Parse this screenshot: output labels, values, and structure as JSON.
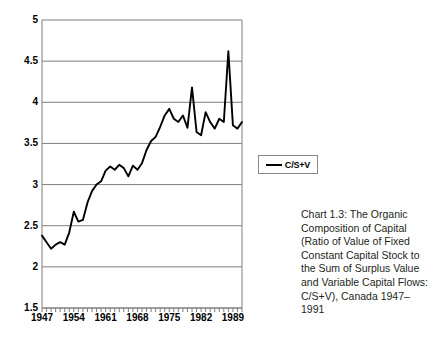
{
  "chart_data": {
    "type": "line",
    "title": "",
    "xlabel": "",
    "ylabel": "",
    "xlim": [
      1947,
      1991
    ],
    "ylim": [
      1.5,
      5
    ],
    "grid": true,
    "grid_axis": "y",
    "legend_position": "right",
    "x": [
      1947,
      1948,
      1949,
      1950,
      1951,
      1952,
      1953,
      1954,
      1955,
      1956,
      1957,
      1958,
      1959,
      1960,
      1961,
      1962,
      1963,
      1964,
      1965,
      1966,
      1967,
      1968,
      1969,
      1970,
      1971,
      1972,
      1973,
      1974,
      1975,
      1976,
      1977,
      1978,
      1979,
      1980,
      1981,
      1982,
      1983,
      1984,
      1985,
      1986,
      1987,
      1988,
      1989,
      1990,
      1991
    ],
    "series": [
      {
        "name": "C/S+V",
        "color": "#000000",
        "values": [
          2.38,
          2.3,
          2.22,
          2.27,
          2.3,
          2.27,
          2.42,
          2.67,
          2.55,
          2.57,
          2.78,
          2.92,
          3.0,
          3.04,
          3.17,
          3.22,
          3.18,
          3.24,
          3.2,
          3.1,
          3.23,
          3.18,
          3.26,
          3.42,
          3.53,
          3.58,
          3.7,
          3.84,
          3.92,
          3.8,
          3.76,
          3.84,
          3.69,
          4.18,
          3.64,
          3.6,
          3.88,
          3.76,
          3.68,
          3.8,
          3.76,
          4.62,
          3.72,
          3.68,
          3.76
        ],
        "values_tail": [
          3.7,
          3.62,
          3.84,
          3.8,
          4.78
        ]
      }
    ],
    "yticks": [
      "5",
      "4.5",
      "4",
      "3.5",
      "3",
      "2.5",
      "2",
      "1.5"
    ],
    "ytick_values": [
      5,
      4.5,
      4,
      3.5,
      3,
      2.5,
      2,
      1.5
    ],
    "xticks": [
      "1947",
      "1954",
      "1961",
      "1968",
      "1975",
      "1982",
      "1989"
    ],
    "xtick_values": [
      1947,
      1954,
      1961,
      1968,
      1975,
      1982,
      1989
    ],
    "xtick_minor_step": 1,
    "legend": [
      {
        "label": "C/S+V",
        "marker": "line",
        "color": "#000000"
      }
    ]
  },
  "caption": {
    "text": "Chart 1.3: The Organic Composition of Capital (Ratio of Value of Fixed Constant Capital Stock to the Sum of Surplus Value and Variable Capital Flows: C/S+V), Canada 1947–1991"
  },
  "colors": {
    "line": "#000000",
    "grid": "#7f7f7f",
    "axis": "#7f7f7f",
    "background": "#ffffff",
    "caption_text": "#231f20"
  }
}
